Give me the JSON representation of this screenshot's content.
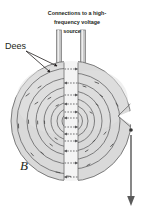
{
  "figure": {
    "kind": "cyclotron-diagram",
    "background_color": "#ffffff",
    "labels": {
      "caption_line1": "Connections to a high-",
      "caption_line2": "frequency voltage",
      "caption_line3": "source",
      "dees_label": "Dees",
      "field_label": "B"
    },
    "colors": {
      "dee_fill": "#d9d9d9",
      "dee_fill_light": "#e6e6e6",
      "dee_edge": "#6f6f6f",
      "orbit_stroke": "#58585a",
      "ink": "#231f20",
      "rod_fill": "#bfbfbf",
      "rod_edge": "#6f6f6f",
      "arrow_color": "#58585a",
      "gap_fill": "#f2f2f2"
    },
    "geometry": {
      "center_x": 71,
      "center_y": 121,
      "disc_radius": 60,
      "gap_left_x": 64,
      "gap_right_x": 78
    },
    "orbit_radii": [
      8,
      13,
      19,
      26,
      34,
      43,
      53
    ],
    "field_arrow": {
      "x": 131,
      "top_y": 133,
      "bottom_y": 205,
      "dot_y": 130,
      "direction": "down"
    },
    "connection_rods": [
      {
        "x": 59,
        "top_y": 30,
        "bottom_y": 68
      },
      {
        "x": 83,
        "top_y": 30,
        "bottom_y": 62
      }
    ],
    "gap_crossing_arrows": 11
  }
}
